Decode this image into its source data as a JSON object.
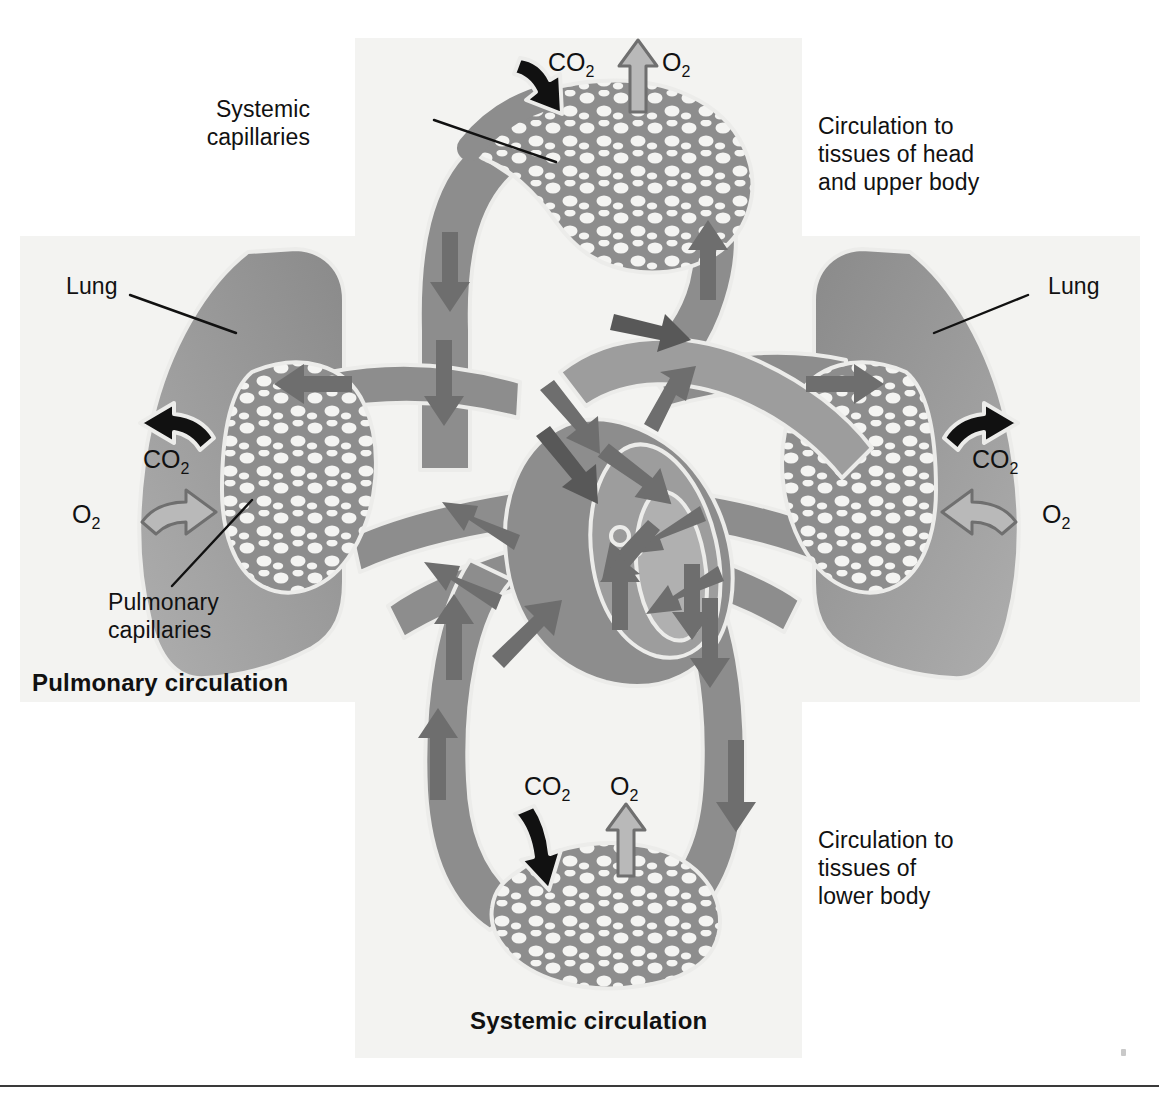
{
  "figure": {
    "bottom_rule": true
  },
  "panels": {
    "vertical_name": "systemic-circulation-panel",
    "horizontal_name": "pulmonary-circulation-panel",
    "fill": "#f3f3f1"
  },
  "captions": {
    "pulmonary": "Pulmonary circulation",
    "systemic": "Systemic circulation"
  },
  "labels": {
    "systemic_capillaries": "Systemic\ncapillaries",
    "pulmonary_capillaries": "Pulmonary\ncapillaries",
    "lung_left": "Lung",
    "lung_right": "Lung",
    "upper_body": "Circulation to\ntissues of head\nand upper body",
    "lower_body": "Circulation to\ntissues of\nlower body"
  },
  "gas_labels": {
    "top_co2": "CO2",
    "top_o2": "O2",
    "left_co2": "CO2",
    "left_o2": "O2",
    "right_co2": "CO2",
    "right_o2": "O2",
    "bottom_co2": "CO2",
    "bottom_o2": "O2"
  },
  "gas_exchange": [
    {
      "site": "systemic-capillaries-upper",
      "co2": "into blood",
      "o2": "out of blood"
    },
    {
      "site": "pulmonary-capillaries-left",
      "co2": "out of blood",
      "o2": "into blood"
    },
    {
      "site": "pulmonary-capillaries-right",
      "co2": "out of blood",
      "o2": "into blood"
    },
    {
      "site": "systemic-capillaries-lower",
      "co2": "into blood",
      "o2": "out of blood"
    }
  ],
  "colors": {
    "panel": "#f3f3f1",
    "vessel": "#8d8d8d",
    "vessel_dark": "#6e6e6e",
    "vessel_light": "#b4b4b4",
    "lung": "#9a9a9a",
    "outline": "#e8e8e6",
    "arrow_black": "#111111",
    "arrow_gray": "#9e9e9e",
    "text": "#111111"
  }
}
